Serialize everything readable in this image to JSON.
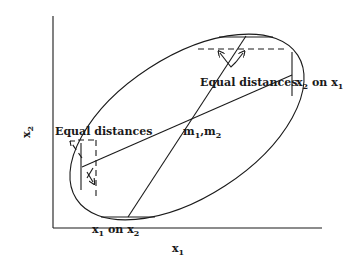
{
  "diagram": {
    "axes": {
      "xlabel": "x",
      "xlabel_sub": "1",
      "ylabel": "x",
      "ylabel_sub": "2"
    },
    "labels": {
      "equal_distances_top": "Equal distances",
      "equal_distances_left": "Equal distances",
      "center": "m",
      "center_sub1": "1",
      "center_sep": ",m",
      "center_sub2": "2",
      "x2_on_x1": {
        "a": "x",
        "a_sub": "2",
        "mid": " on x",
        "b_sub": "1"
      },
      "x1_on_x2": {
        "a": "x",
        "a_sub": "1",
        "mid": " on x",
        "b_sub": "2"
      }
    },
    "elements": [
      "ellipse",
      "regression-line-x2-on-x1",
      "regression-line-x1-on-x2",
      "tangent-line-top",
      "tangent-line-bottom",
      "tangent-line-right",
      "tangent-line-left",
      "dashed-guide-top",
      "dashed-guide-left"
    ]
  }
}
